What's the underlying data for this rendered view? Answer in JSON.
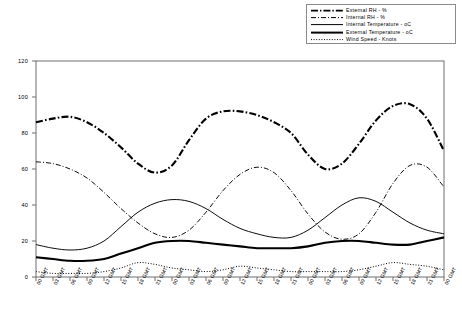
{
  "chart_data": {
    "type": "line",
    "title": "",
    "xlabel": "",
    "ylabel": "",
    "ylim": [
      0,
      120
    ],
    "yticks": [
      0,
      20,
      40,
      60,
      80,
      100,
      120
    ],
    "grid": false,
    "legend_position": "top-right",
    "x": [
      "00 GMT",
      "03 GMT",
      "06 GMT",
      "09 GMT",
      "12 GMT",
      "15 GMT",
      "18 GMT",
      "21 GMT",
      "00 GMT",
      "03 GMT",
      "06 GMT",
      "09 GMT",
      "12 GMT",
      "15 GMT",
      "18 GMT",
      "21 GMT",
      "00 GMT",
      "03 GMT",
      "06 GMT",
      "09 GMT",
      "12 GMT",
      "15 GMT",
      "18 GMT",
      "21 GMT",
      "00 GMT"
    ],
    "series": [
      {
        "name": "External RH - %",
        "style": "thick-dash-dot",
        "values": [
          86,
          88,
          89,
          86,
          80,
          72,
          63,
          58,
          62,
          76,
          88,
          92,
          92,
          90,
          86,
          80,
          68,
          60,
          63,
          74,
          87,
          95,
          96,
          88,
          70
        ]
      },
      {
        "name": "Internal RH - %",
        "style": "thin-dash-dot",
        "values": [
          64,
          63,
          60,
          55,
          47,
          38,
          30,
          24,
          22,
          26,
          36,
          48,
          57,
          61,
          58,
          48,
          35,
          25,
          21,
          24,
          36,
          52,
          62,
          61,
          50
        ]
      },
      {
        "name": "Internal Temperature - oC",
        "style": "thin-solid",
        "values": [
          18,
          16,
          15,
          16,
          20,
          28,
          36,
          41,
          43,
          42,
          38,
          32,
          27,
          24,
          22,
          22,
          26,
          33,
          40,
          44,
          42,
          36,
          30,
          26,
          24
        ]
      },
      {
        "name": "External Temperature - oC",
        "style": "thick-solid",
        "values": [
          11,
          10,
          9,
          9,
          10,
          13,
          16,
          19,
          20,
          20,
          19,
          18,
          17,
          16,
          16,
          16,
          17,
          19,
          20,
          20,
          19,
          18,
          18,
          20,
          22
        ]
      },
      {
        "name": "Wind Speed - Knots",
        "style": "dotted",
        "values": [
          3,
          2,
          2,
          2,
          3,
          5,
          8,
          7,
          5,
          4,
          3,
          4,
          6,
          5,
          4,
          3,
          3,
          3,
          3,
          4,
          6,
          8,
          7,
          6,
          4
        ]
      }
    ]
  },
  "legend": {
    "items": [
      {
        "label": "External RH - %"
      },
      {
        "label": "Internal RH - %"
      },
      {
        "label": "Internal Temperature - oC"
      },
      {
        "label": "External Temperature - oC"
      },
      {
        "label": "Wind Speed - Knots"
      }
    ]
  },
  "colors": {
    "axis": "#6f6f6f",
    "line": "#000000",
    "background": "#ffffff",
    "legend_border": "#8a8a8a"
  }
}
